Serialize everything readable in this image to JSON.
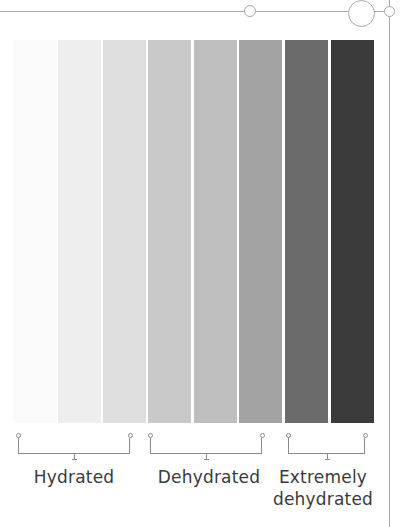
{
  "diagram": {
    "type": "urine color hydration chart",
    "swatches": [
      {
        "index": 1,
        "color": "#fafafa"
      },
      {
        "index": 2,
        "color": "#eeeeee"
      },
      {
        "index": 3,
        "color": "#dedede"
      },
      {
        "index": 4,
        "color": "#c9c9c9"
      },
      {
        "index": 5,
        "color": "#bebebe"
      },
      {
        "index": 6,
        "color": "#a3a3a3"
      },
      {
        "index": 7,
        "color": "#6b6b6b"
      },
      {
        "index": 8,
        "color": "#3b3b3b"
      }
    ],
    "groups": [
      {
        "label": "Hydrated",
        "swatch_range": [
          1,
          3
        ]
      },
      {
        "label": "Dehydrated",
        "swatch_range": [
          4,
          6
        ]
      },
      {
        "label": "Extremely dehydrated",
        "label_line1": "Extremely",
        "label_line2": "dehydrated",
        "swatch_range": [
          7,
          8
        ]
      }
    ],
    "line_color": "#a8a8a8"
  }
}
